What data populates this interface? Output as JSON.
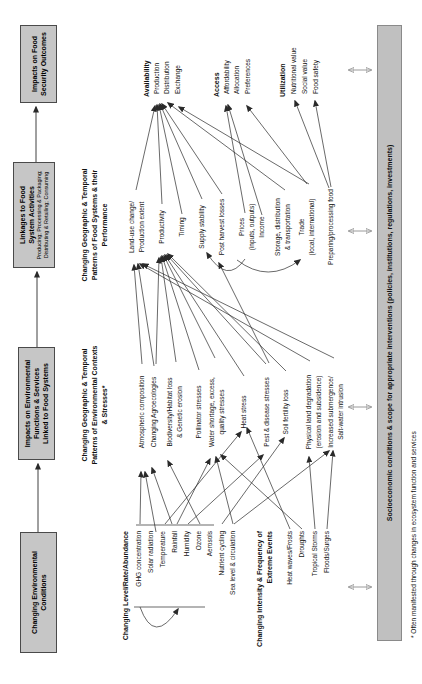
{
  "colors": {
    "box_fill": "#c6c6c6",
    "box_border": "#4a4a4a",
    "bar_fill": "#c0c0c0",
    "bar_border": "#8a8a8a",
    "arrow": "#2a2a2a",
    "double_arrow": "#8f8f8f",
    "text": "#111111"
  },
  "boxes": [
    {
      "id": "changing-environmental-conditions",
      "x": 31,
      "y": 20,
      "w": 121,
      "h": 37,
      "lines": [
        "Changing Environmental",
        "Conditions"
      ],
      "sublines": []
    },
    {
      "id": "impacts-on-environmental-functions",
      "x": 224,
      "y": 18,
      "w": 113,
      "h": 37,
      "lines": [
        "Impacts on Environmental",
        "Functions & Services",
        "Linked to Food Systems"
      ],
      "sublines": []
    },
    {
      "id": "linkages-to-food-system-activities",
      "x": 416,
      "y": 13,
      "w": 106,
      "h": 42,
      "lines": [
        "Linkages to Food",
        "System Activities"
      ],
      "sublines": [
        "Producing; Processing & Packaging;",
        "Distributing & Retailing; Consuming"
      ]
    },
    {
      "id": "impacts-on-food-security-outcomes",
      "x": 581,
      "y": 20,
      "w": 78,
      "h": 37,
      "lines": [
        "Impacts on Food",
        "Security Outcomes"
      ],
      "sublines": []
    }
  ],
  "columns": [
    {
      "id": "environmental-conditions",
      "align": "right",
      "anchor_x": 153,
      "entries": [
        {
          "text": "Changing Level/Rate/Abundance",
          "y": 126,
          "b": true
        },
        {
          "text": "GHG concentration",
          "y": 139
        },
        {
          "text": "Solar radiation",
          "y": 151
        },
        {
          "text": "Temperature",
          "y": 163
        },
        {
          "text": "Rainfall",
          "y": 175
        },
        {
          "text": "Humidity",
          "y": 187
        },
        {
          "text": "Ozone",
          "y": 199
        },
        {
          "text": "Aerosols",
          "y": 210
        },
        {
          "text": "Nutrient cycling",
          "y": 222
        },
        {
          "text": "Sea level & circulation",
          "y": 233
        },
        {
          "text": "Changing Intensity & Frequency of\nExtreme Events",
          "y": 260,
          "b": true
        },
        {
          "text": "Heat waves/Frosts",
          "y": 290
        },
        {
          "text": "Droughts",
          "y": 302
        },
        {
          "text": "Tropical Storms",
          "y": 315
        },
        {
          "text": "Floods/Surges",
          "y": 327
        }
      ]
    },
    {
      "id": "environmental-stresses",
      "align": "center",
      "anchor_x": 272,
      "entries": [
        {
          "text": "Changing Geographic & Temporal\nPatterns of Environmental Contexts\n& Stresses*",
          "y": 85,
          "b": true,
          "x": 279
        },
        {
          "text": "Atmospheric composition",
          "y": 142
        },
        {
          "text": "Changing Agroecologies",
          "y": 154
        },
        {
          "text": "Biodiversity/Habitat loss\n& Genetic erosion",
          "y": 170
        },
        {
          "text": "Pollinator stresses",
          "y": 199
        },
        {
          "text": "Water shortage, excess,\nquality stresses",
          "y": 212
        },
        {
          "text": "Heat stress",
          "y": 244
        },
        {
          "text": "Pest & disease stresses",
          "y": 267
        },
        {
          "text": "Soil fertility loss",
          "y": 286
        },
        {
          "text": "Physical land degradation\n(erosion and subsidence)",
          "y": 309
        },
        {
          "text": "Increased submergence/\nSalt-water intrusion",
          "y": 331
        }
      ]
    },
    {
      "id": "food-systems-performance",
      "align": "center",
      "anchor_x": 457,
      "entries": [
        {
          "text": "Changing Geographic & Temporal\nPatterns of Food Systems & their\nPerformance",
          "y": 85,
          "b": true,
          "x": 459
        },
        {
          "text": "Land-use change/\nProduction extent",
          "y": 132
        },
        {
          "text": "Productivity",
          "y": 162
        },
        {
          "text": "Timing",
          "y": 182
        },
        {
          "text": "Supply stability",
          "y": 202
        },
        {
          "text": "Post harvest losses",
          "y": 222
        },
        {
          "text": "Prices\n(inputs, outputs)",
          "y": 242
        },
        {
          "text": "Income",
          "y": 262
        },
        {
          "text": "Storage, distribution\n& transportation",
          "y": 278
        },
        {
          "text": "Trade\n(local, international)",
          "y": 302
        },
        {
          "text": "Preparing/processing food",
          "y": 331
        }
      ]
    },
    {
      "id": "food-security-outcomes",
      "align": "left",
      "anchor_x": 587,
      "entries": [
        {
          "text": "Availability",
          "y": 147,
          "b": true,
          "x": 587
        },
        {
          "text": "Production",
          "y": 157,
          "x": 590
        },
        {
          "text": "Distribution",
          "y": 167,
          "x": 590
        },
        {
          "text": "Exchange",
          "y": 178,
          "x": 590
        },
        {
          "text": "Access",
          "y": 217,
          "b": true,
          "x": 587
        },
        {
          "text": "Affordability",
          "y": 227,
          "x": 590
        },
        {
          "text": "Allocation",
          "y": 237,
          "x": 590
        },
        {
          "text": "Preferences",
          "y": 248,
          "x": 590
        },
        {
          "text": "Utilization",
          "y": 283,
          "b": true,
          "x": 587
        },
        {
          "text": "Nutritional value",
          "y": 294,
          "x": 590
        },
        {
          "text": "Social value",
          "y": 305,
          "x": 590
        },
        {
          "text": "Food safety",
          "y": 316,
          "x": 590
        }
      ]
    }
  ],
  "bar": {
    "text": "Socioeconomic conditions & scope for appropriate interventions (policies, institutions, regulations, investments)",
    "x": 43,
    "y": 377,
    "w": 616,
    "h": 25
  },
  "footnote": {
    "text": "* Often manifested through changes in ecosystem function and services",
    "x": 46,
    "y": 410
  },
  "arrows": {
    "flow": [
      [
        152,
        38,
        220,
        38
      ],
      [
        337,
        37,
        412,
        37
      ],
      [
        522,
        36,
        577,
        36
      ]
    ],
    "straight": [
      [
        160,
        140,
        212,
        141
      ],
      [
        152,
        156,
        212,
        145
      ],
      [
        160,
        165,
        252,
        241
      ],
      [
        160,
        172,
        216,
        152
      ],
      [
        160,
        177,
        225,
        210
      ],
      [
        160,
        188,
        229,
        263
      ],
      [
        160,
        200,
        223,
        168
      ],
      [
        160,
        222,
        246,
        284
      ],
      [
        160,
        233,
        227,
        216
      ],
      [
        160,
        234,
        233,
        329
      ],
      [
        155,
        290,
        256,
        247
      ],
      [
        155,
        302,
        229,
        221
      ],
      [
        155,
        315,
        227,
        309
      ],
      [
        155,
        327,
        233,
        333
      ],
      [
        320,
        142,
        419,
        134
      ],
      [
        318,
        154,
        420,
        138
      ],
      [
        320,
        156,
        426,
        159
      ],
      [
        322,
        176,
        427,
        161
      ],
      [
        314,
        199,
        428,
        162
      ],
      [
        326,
        215,
        428,
        164
      ],
      [
        308,
        244,
        429,
        165
      ],
      [
        320,
        266,
        429,
        167
      ],
      [
        321,
        269,
        421,
        219
      ],
      [
        313,
        286,
        430,
        168
      ],
      [
        323,
        310,
        420,
        140
      ],
      [
        326,
        334,
        420,
        143
      ],
      [
        494,
        136,
        578,
        155
      ],
      [
        480,
        162,
        579,
        157
      ],
      [
        470,
        182,
        579,
        159
      ],
      [
        485,
        202,
        580,
        160
      ],
      [
        490,
        222,
        580,
        162
      ],
      [
        500,
        309,
        577,
        179
      ],
      [
        494,
        285,
        581,
        168
      ],
      [
        471,
        245,
        578,
        226
      ],
      [
        469,
        262,
        579,
        228
      ],
      [
        500,
        307,
        578,
        247
      ],
      [
        497,
        331,
        583,
        315
      ],
      [
        496,
        329,
        583,
        295
      ]
    ],
    "lines": [
      [
        159,
        136,
        159,
        214
      ],
      [
        77,
        134,
        77,
        205
      ]
    ],
    "curved": [
      "M77,140 Q38,154 75,178",
      "M425,245 Q399,227 431,207",
      "M424,237 Q400,268 424,300"
    ],
    "double": [
      [
        97,
        349,
        371
      ],
      [
        277,
        349,
        371
      ],
      [
        453,
        349,
        371
      ],
      [
        614,
        349,
        371
      ]
    ]
  }
}
